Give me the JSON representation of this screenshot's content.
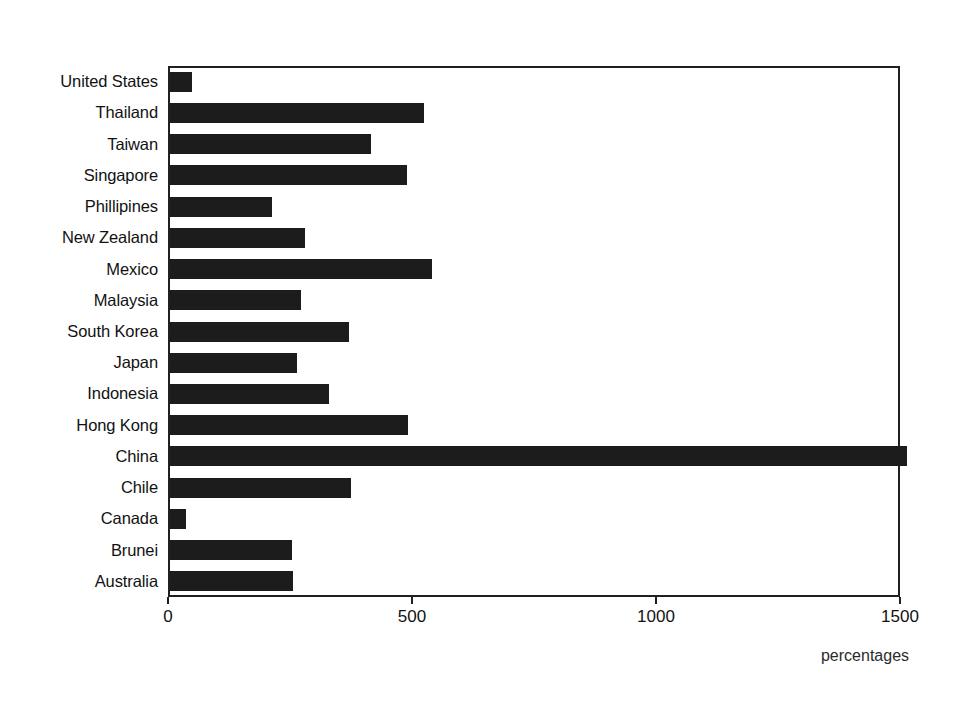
{
  "chart_data": {
    "type": "bar",
    "orientation": "horizontal",
    "title": "",
    "subtitle": "",
    "xlabel": "percentages",
    "ylabel": "",
    "xlim": [
      0,
      1500
    ],
    "xticks": [
      0,
      500,
      1000,
      1500
    ],
    "xtick_labels": [
      "0",
      "500",
      "1000",
      "1500"
    ],
    "grid": false,
    "legend": null,
    "bar_color": "#1c1c1c",
    "axis_color": "#202020",
    "background": "#ffffff",
    "categories": [
      "United States",
      "Thailand",
      "Taiwan",
      "Singapore",
      "Phillipines",
      "New Zealand",
      "Mexico",
      "Malaysia",
      "South Korea",
      "Japan",
      "Indonesia",
      "Hong Kong",
      "China",
      "Chile",
      "Canada",
      "Brunei",
      "Australia"
    ],
    "values": [
      45,
      520,
      412,
      485,
      209,
      277,
      537,
      268,
      367,
      260,
      326,
      487,
      1510,
      370,
      33,
      250,
      252
    ]
  }
}
